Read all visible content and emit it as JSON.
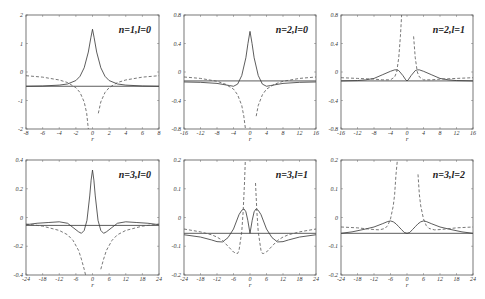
{
  "chart_data": [
    {
      "type": "line",
      "title": "n=1,l=0",
      "xlabel": "r",
      "ylabel": "",
      "xlim": [
        -8,
        8
      ],
      "ylim": [
        -2,
        2
      ],
      "xticks": [
        -8,
        -6,
        -4,
        -2,
        0,
        2,
        4,
        6,
        8
      ],
      "xtick_labels": [
        "-8",
        "-6",
        "-4",
        "-2",
        "0",
        "2",
        "4",
        "6",
        "8"
      ],
      "yticks": [
        -2,
        -1,
        0,
        1,
        2
      ],
      "ytick_labels": [
        "-2",
        "-1",
        "0",
        "1",
        "2"
      ],
      "hline": -0.5,
      "series": [
        {
          "name": "solid",
          "style": "solid",
          "x": [
            -8,
            -6,
            -4,
            -3,
            -2,
            -1.5,
            -1,
            -0.5,
            -0.2,
            0,
            0.2,
            0.5,
            1,
            1.5,
            2,
            3,
            4,
            6,
            8
          ],
          "y": [
            -0.5,
            -0.49,
            -0.46,
            -0.42,
            -0.3,
            -0.15,
            0.15,
            0.7,
            1.2,
            1.5,
            1.2,
            0.7,
            0.15,
            -0.15,
            -0.3,
            -0.42,
            -0.46,
            -0.49,
            -0.5
          ]
        },
        {
          "name": "dashed",
          "style": "dashed",
          "x": [
            -8,
            -6,
            -4,
            -3,
            -2,
            -1.5,
            -1,
            -0.7,
            -0.5,
            0.5,
            0.7,
            1,
            1.5,
            2,
            3,
            4,
            6,
            8
          ],
          "y": [
            -0.13,
            -0.18,
            -0.28,
            -0.37,
            -0.55,
            -0.72,
            -1.05,
            -1.45,
            -2,
            null,
            -1.45,
            -1.05,
            -0.72,
            -0.55,
            -0.37,
            -0.28,
            -0.18,
            -0.13
          ]
        }
      ]
    },
    {
      "type": "line",
      "title": "n=2,l=0",
      "xlabel": "r",
      "ylabel": "",
      "xlim": [
        -16,
        16
      ],
      "ylim": [
        -0.8,
        0.8
      ],
      "xticks": [
        -16,
        -12,
        -8,
        -4,
        0,
        4,
        8,
        12,
        16
      ],
      "xtick_labels": [
        "-16",
        "-12",
        "-8",
        "-4",
        "0",
        "4",
        "8",
        "12",
        "16"
      ],
      "yticks": [
        -0.8,
        -0.4,
        0,
        0.4,
        0.8
      ],
      "ytick_labels": [
        "-0.8",
        "-0.4",
        "0",
        "0.4",
        "0.8"
      ],
      "hline": -0.125,
      "series": [
        {
          "name": "solid",
          "style": "solid",
          "x": [
            -16,
            -12,
            -8,
            -5,
            -4,
            -3,
            -2,
            -1,
            -0.5,
            0,
            0.5,
            1,
            2,
            3,
            4,
            5,
            8,
            12,
            16
          ],
          "y": [
            -0.14,
            -0.145,
            -0.16,
            -0.19,
            -0.2,
            -0.17,
            -0.05,
            0.2,
            0.4,
            0.57,
            0.4,
            0.2,
            -0.05,
            -0.17,
            -0.2,
            -0.19,
            -0.16,
            -0.145,
            -0.14
          ]
        },
        {
          "name": "dashed",
          "style": "dashed",
          "x": [
            -16,
            -12,
            -8,
            -6,
            -4,
            -3,
            -2,
            -1.5,
            -1.1,
            1.1,
            1.5,
            2,
            3,
            4,
            6,
            8,
            12,
            16
          ],
          "y": [
            -0.07,
            -0.09,
            -0.13,
            -0.17,
            -0.24,
            -0.32,
            -0.47,
            -0.62,
            -0.8,
            null,
            -0.62,
            -0.47,
            -0.32,
            -0.24,
            -0.17,
            -0.13,
            -0.09,
            -0.07
          ]
        }
      ]
    },
    {
      "type": "line",
      "title": "n=2,l=1",
      "xlabel": "r",
      "ylabel": "",
      "xlim": [
        -16,
        16
      ],
      "ylim": [
        -0.8,
        0.8
      ],
      "xticks": [
        -16,
        -12,
        -8,
        -4,
        0,
        4,
        8,
        12,
        16
      ],
      "xtick_labels": [
        "-16",
        "-12",
        "-8",
        "-4",
        "0",
        "4",
        "8",
        "12",
        "16"
      ],
      "yticks": [
        -0.8,
        -0.4,
        0,
        0.4,
        0.8
      ],
      "ytick_labels": [
        "-0.8",
        "-0.4",
        "0",
        "0.4",
        "0.8"
      ],
      "hline": -0.125,
      "series": [
        {
          "name": "solid",
          "style": "solid",
          "x": [
            -16,
            -12,
            -10,
            -8,
            -6,
            -4,
            -3,
            -2.5,
            -2,
            -1,
            -0.3,
            0,
            0.3,
            1,
            2,
            2.5,
            3,
            4,
            6,
            8,
            10,
            12,
            16
          ],
          "y": [
            -0.125,
            -0.12,
            -0.11,
            -0.09,
            -0.04,
            0.01,
            0.03,
            0.03,
            0.02,
            -0.05,
            -0.11,
            -0.125,
            -0.11,
            -0.05,
            0.02,
            0.03,
            0.03,
            0.01,
            -0.04,
            -0.09,
            -0.11,
            -0.12,
            -0.125
          ]
        },
        {
          "name": "dashed",
          "style": "dashed",
          "x": [
            -16,
            -12,
            -8,
            -6,
            -4,
            -3,
            -2.5,
            -2,
            -1.6,
            -1.3,
            1.3,
            1.6,
            2,
            2.5,
            3,
            4,
            6,
            8,
            12,
            16
          ],
          "y": [
            -0.08,
            -0.09,
            -0.1,
            -0.11,
            -0.11,
            -0.07,
            0,
            0.2,
            0.5,
            0.8,
            null,
            0.5,
            0.2,
            0,
            -0.07,
            -0.11,
            -0.11,
            -0.1,
            -0.09,
            -0.08
          ]
        }
      ]
    },
    {
      "type": "line",
      "title": "n=3,l=0",
      "xlabel": "r",
      "ylabel": "",
      "xlim": [
        -24,
        24
      ],
      "ylim": [
        -0.4,
        0.4
      ],
      "xticks": [
        -24,
        -18,
        -12,
        -6,
        0,
        6,
        12,
        18,
        24
      ],
      "xtick_labels": [
        "-24",
        "-18",
        "-12",
        "-6",
        "0",
        "6",
        "12",
        "18",
        "24"
      ],
      "yticks": [
        -0.4,
        -0.2,
        0,
        0.2,
        0.4
      ],
      "ytick_labels": [
        "-0.4",
        "-0.2",
        "0",
        "0.2",
        "0.4"
      ],
      "hline": -0.055,
      "series": [
        {
          "name": "solid",
          "style": "solid",
          "x": [
            -24,
            -20,
            -16,
            -12,
            -9,
            -7,
            -5,
            -4,
            -3,
            -2,
            -1,
            -0.5,
            0,
            0.5,
            1,
            2,
            3,
            4,
            5,
            7,
            9,
            12,
            16,
            20,
            24
          ],
          "y": [
            -0.05,
            -0.04,
            -0.035,
            -0.03,
            -0.04,
            -0.07,
            -0.1,
            -0.11,
            -0.09,
            -0.02,
            0.15,
            0.26,
            0.33,
            0.26,
            0.15,
            -0.02,
            -0.09,
            -0.11,
            -0.1,
            -0.07,
            -0.04,
            -0.03,
            -0.035,
            -0.04,
            -0.05
          ]
        },
        {
          "name": "dashed",
          "style": "dashed",
          "x": [
            -24,
            -18,
            -12,
            -9,
            -7,
            -5,
            -4,
            -3,
            -2.5,
            2.5,
            3,
            4,
            5,
            7,
            9,
            12,
            18,
            24
          ],
          "y": [
            -0.045,
            -0.06,
            -0.09,
            -0.12,
            -0.16,
            -0.23,
            -0.29,
            -0.36,
            -0.4,
            null,
            -0.36,
            -0.29,
            -0.23,
            -0.16,
            -0.12,
            -0.09,
            -0.06,
            -0.045
          ]
        }
      ]
    },
    {
      "type": "line",
      "title": "n=3,l=1",
      "xlabel": "r",
      "ylabel": "",
      "xlim": [
        -24,
        24
      ],
      "ylim": [
        -0.2,
        0.2
      ],
      "xticks": [
        -24,
        -18,
        -12,
        -6,
        0,
        6,
        12,
        18,
        24
      ],
      "xtick_labels": [
        "-24",
        "-18",
        "-12",
        "-6",
        "0",
        "6",
        "12",
        "18",
        "24"
      ],
      "yticks": [
        -0.2,
        -0.1,
        0,
        0.1,
        0.2
      ],
      "ytick_labels": [
        "-0.2",
        "-0.1",
        "0",
        "0.1",
        "0.2"
      ],
      "hline": -0.055,
      "series": [
        {
          "name": "solid",
          "style": "solid",
          "x": [
            -24,
            -18,
            -14,
            -12,
            -10,
            -8,
            -6,
            -4,
            -3,
            -2.2,
            -1.5,
            -0.8,
            0,
            0.8,
            1.5,
            2.2,
            3,
            4,
            6,
            8,
            10,
            12,
            14,
            18,
            24
          ],
          "y": [
            -0.06,
            -0.068,
            -0.078,
            -0.084,
            -0.085,
            -0.07,
            -0.04,
            0.01,
            0.025,
            0.03,
            0.02,
            -0.01,
            -0.055,
            -0.01,
            0.02,
            0.03,
            0.025,
            0.01,
            -0.04,
            -0.07,
            -0.085,
            -0.084,
            -0.078,
            -0.068,
            -0.06
          ]
        },
        {
          "name": "dashed",
          "style": "dashed",
          "x": [
            -24,
            -18,
            -14,
            -12,
            -10,
            -8,
            -6,
            -5,
            -4.5,
            -4,
            -3,
            -2.5,
            -2,
            -1.7,
            1.7,
            2,
            2.5,
            3,
            4,
            4.5,
            5,
            6,
            8,
            10,
            12,
            14,
            18,
            24
          ],
          "y": [
            -0.04,
            -0.05,
            -0.06,
            -0.068,
            -0.08,
            -0.1,
            -0.12,
            -0.125,
            -0.125,
            -0.115,
            -0.05,
            0.02,
            0.12,
            0.2,
            null,
            0.12,
            0.02,
            -0.05,
            -0.115,
            -0.125,
            -0.125,
            -0.12,
            -0.1,
            -0.08,
            -0.068,
            -0.06,
            -0.05,
            -0.04
          ]
        }
      ]
    },
    {
      "type": "line",
      "title": "n=3,l=2",
      "xlabel": "r",
      "ylabel": "",
      "xlim": [
        -24,
        24
      ],
      "ylim": [
        -0.2,
        0.2
      ],
      "xticks": [
        -24,
        -18,
        -12,
        -6,
        0,
        6,
        12,
        18,
        24
      ],
      "xtick_labels": [
        "-24",
        "-18",
        "-12",
        "-6",
        "0",
        "6",
        "12",
        "18",
        "24"
      ],
      "yticks": [
        -0.2,
        -0.1,
        0,
        0.1,
        0.2
      ],
      "ytick_labels": [
        "-0.2",
        "-0.1",
        "0",
        "0.1",
        "0.2"
      ],
      "hline": -0.055,
      "series": [
        {
          "name": "solid",
          "style": "solid",
          "x": [
            -24,
            -20,
            -16,
            -12,
            -9,
            -7,
            -6,
            -5,
            -4,
            -3,
            -2,
            -1,
            0,
            1,
            2,
            3,
            4,
            5,
            6,
            7,
            9,
            12,
            16,
            20,
            24
          ],
          "y": [
            -0.055,
            -0.05,
            -0.042,
            -0.033,
            -0.022,
            -0.014,
            -0.012,
            -0.015,
            -0.022,
            -0.032,
            -0.042,
            -0.052,
            -0.055,
            -0.052,
            -0.042,
            -0.032,
            -0.022,
            -0.015,
            -0.012,
            -0.014,
            -0.022,
            -0.033,
            -0.042,
            -0.05,
            -0.055
          ]
        },
        {
          "name": "dashed",
          "style": "dashed",
          "x": [
            -24,
            -18,
            -14,
            -12,
            -10,
            -8,
            -7,
            -6,
            -5,
            -4.5,
            -4,
            -3.5,
            3.5,
            4,
            4.5,
            5,
            6,
            7,
            8,
            10,
            12,
            14,
            18,
            24
          ],
          "y": [
            -0.033,
            -0.036,
            -0.04,
            -0.042,
            -0.043,
            -0.038,
            -0.028,
            -0.005,
            0.04,
            0.08,
            0.15,
            0.2,
            null,
            0.15,
            0.08,
            0.04,
            -0.005,
            -0.028,
            -0.038,
            -0.043,
            -0.042,
            -0.04,
            -0.036,
            -0.033
          ]
        }
      ]
    }
  ]
}
